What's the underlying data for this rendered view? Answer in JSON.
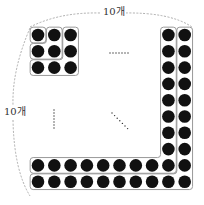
{
  "diagram": {
    "type": "square-number-pattern",
    "grid_size": 10,
    "top_label": "10개",
    "left_label": "10개",
    "dot_color": "#111111",
    "group_border_color": "#9a9a9a",
    "dashed_arc_color": "#999999",
    "groups_shown": [
      {
        "name": "group-1",
        "count": 1,
        "shape": "1x1 square"
      },
      {
        "name": "group-2",
        "count": 3,
        "shape": "L-shape completing 2x2"
      },
      {
        "name": "group-3",
        "count": 5,
        "shape": "L-shape completing 3x3"
      },
      {
        "name": "group-9",
        "count": 17,
        "shape": "L-shape completing 9x9"
      },
      {
        "name": "group-10",
        "count": 19,
        "shape": "L-shape completing 10x10"
      }
    ],
    "ellipsis_marks": [
      "horizontal",
      "vertical",
      "diagonal"
    ]
  }
}
